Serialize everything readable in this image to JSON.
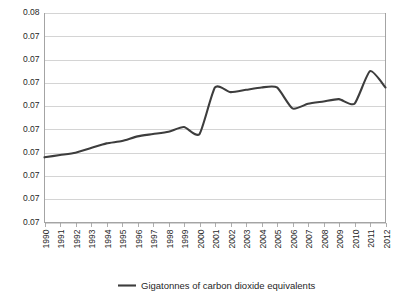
{
  "chart_data": {
    "type": "line",
    "title": "",
    "xlabel": "",
    "ylabel": "",
    "grid": true,
    "legend_position": "bottom",
    "x": [
      1990,
      1991,
      1992,
      1993,
      1994,
      1995,
      1996,
      1997,
      1998,
      1999,
      2000,
      2001,
      2002,
      2003,
      2004,
      2005,
      2006,
      2007,
      2008,
      2009,
      2010,
      2011,
      2012
    ],
    "xtick_labels": [
      "1990",
      "1991",
      "1992",
      "1993",
      "1994",
      "1995",
      "1996",
      "1997",
      "1998",
      "1999",
      "2000",
      "2001",
      "2002",
      "2003",
      "2004",
      "2005",
      "2006",
      "2007",
      "2008",
      "2009",
      "2010",
      "2011",
      "2012"
    ],
    "ytick_labels": [
      "0.08",
      "0.07",
      "0.07",
      "0.07",
      "0.07",
      "0.07",
      "0.07",
      "0.07",
      "0.07",
      "0.07"
    ],
    "ytick_values": [
      0.08,
      0.079,
      0.078,
      0.077,
      0.076,
      0.075,
      0.074,
      0.073,
      0.072,
      0.071
    ],
    "ylim": [
      0.071,
      0.08
    ],
    "xlim": [
      1990,
      2012
    ],
    "series": [
      {
        "name": "Gigatonnes of carbon dioxide equivalents",
        "color": "#3d3d3d",
        "values": [
          0.0738,
          0.0739,
          0.074,
          0.0742,
          0.0744,
          0.0745,
          0.0747,
          0.0748,
          0.0749,
          0.0751,
          0.0748,
          0.0768,
          0.0766,
          0.0767,
          0.0768,
          0.0768,
          0.0759,
          0.0761,
          0.0762,
          0.0763,
          0.0761,
          0.0775,
          0.0768
        ]
      }
    ],
    "legend": [
      {
        "label": "Gigatonnes of carbon dioxide equivalents",
        "color": "#3d3d3d",
        "marker": "line"
      }
    ],
    "colors": {
      "series": "#3d3d3d",
      "grid": "#c9c9c9",
      "axis": "#9a9a9a",
      "text": "#1f1f1f",
      "background": "#ffffff"
    }
  }
}
